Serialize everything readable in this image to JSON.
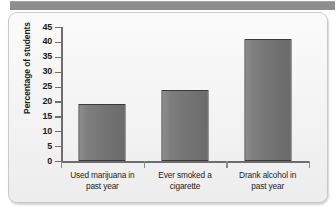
{
  "panel": {
    "header_band_color": "#8e8e8e",
    "background_color": "#f4f4f4",
    "border_color": "#c9c9c9"
  },
  "chart_data": {
    "type": "bar",
    "title": "",
    "subtitle": "",
    "xlabel": "",
    "ylabel": "Percentage of students",
    "categories": [
      "Used marijuana in past year",
      "Ever smoked a cigarette",
      "Drank alcohol in past year"
    ],
    "category_lines": [
      [
        "Used marijuana in",
        "past year"
      ],
      [
        "Ever smoked a",
        "cigarette"
      ],
      [
        "Drank alcohol in",
        "past year"
      ]
    ],
    "values": [
      19,
      24,
      41
    ],
    "ylim": [
      0,
      45
    ],
    "ytick_step": 5,
    "yticks": [
      0,
      5,
      10,
      15,
      20,
      25,
      30,
      35,
      40,
      45
    ],
    "ytick_labels": [
      "0",
      "5",
      "10",
      "15",
      "20",
      "25",
      "30",
      "35",
      "40",
      "45"
    ],
    "grid": false,
    "legend": null,
    "bar_fill_light": "#8d8d8d",
    "bar_fill_dark": "#6b6b6b",
    "bar_border": "#3a3a3a",
    "axis_color": "#6d6d6d"
  }
}
